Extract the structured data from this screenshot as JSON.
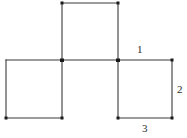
{
  "figure": {
    "background_color": "#ffffff",
    "line_color": "#3a3a3a",
    "vertex_color": "#1a1a1a",
    "label_color": "#2b2b2b",
    "squares": [
      {
        "name": "top-square",
        "x": 62,
        "y": 3,
        "width": 56,
        "height": 57
      },
      {
        "name": "left-square",
        "x": 6,
        "y": 60,
        "width": 56,
        "height": 58
      },
      {
        "name": "right-square",
        "x": 118,
        "y": 60,
        "width": 54,
        "height": 58
      }
    ],
    "vertices": [
      {
        "name": "top-square-top-left",
        "x": 62,
        "y": 3
      },
      {
        "name": "top-square-top-right",
        "x": 118,
        "y": 3
      },
      {
        "name": "center-left-junction",
        "x": 62,
        "y": 60
      },
      {
        "name": "center-right-junction",
        "x": 118,
        "y": 60
      },
      {
        "name": "right-square-top-right",
        "x": 172,
        "y": 60
      },
      {
        "name": "left-square-bottom-left",
        "x": 6,
        "y": 118
      },
      {
        "name": "left-square-bottom-right",
        "x": 62,
        "y": 118
      },
      {
        "name": "right-square-bottom-left",
        "x": 118,
        "y": 118
      },
      {
        "name": "right-square-bottom-right",
        "x": 172,
        "y": 118
      }
    ],
    "labels": {
      "top_side": "1",
      "right_side": "2",
      "bottom_side": "3"
    }
  }
}
